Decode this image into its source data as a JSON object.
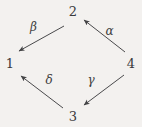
{
  "diagram": {
    "kind": "commutative-diagram",
    "shape": "diamond",
    "background_color": "#f3f1ef",
    "stroke_color": "#4a4a4c",
    "nodes": [
      {
        "id": "node-2",
        "label": "2",
        "position": "top",
        "x": 73,
        "y": 12
      },
      {
        "id": "node-1",
        "label": "1",
        "position": "left",
        "x": 9,
        "y": 64
      },
      {
        "id": "node-4",
        "label": "4",
        "position": "right",
        "x": 131,
        "y": 64
      },
      {
        "id": "node-3",
        "label": "3",
        "position": "bottom",
        "x": 73,
        "y": 117
      }
    ],
    "edges": [
      {
        "id": "edge-beta",
        "label": "β",
        "label_name": "beta",
        "from": "2",
        "to": "1",
        "direction": "down-left",
        "x1": 64,
        "y1": 26,
        "x2": 17,
        "y2": 52
      },
      {
        "id": "edge-alpha",
        "label": "α",
        "label_name": "alpha",
        "from": "4",
        "to": "2",
        "direction": "up-left",
        "x1": 125,
        "y1": 52,
        "x2": 82,
        "y2": 19
      },
      {
        "id": "edge-delta",
        "label": "δ",
        "label_name": "delta",
        "from": "3",
        "to": "1",
        "direction": "up-left",
        "x1": 63,
        "y1": 108,
        "x2": 19,
        "y2": 75
      },
      {
        "id": "edge-gamma",
        "label": "γ",
        "label_name": "gamma",
        "from": "4",
        "to": "3",
        "direction": "down-left",
        "x1": 124,
        "y1": 75,
        "x2": 82,
        "y2": 106
      }
    ]
  }
}
